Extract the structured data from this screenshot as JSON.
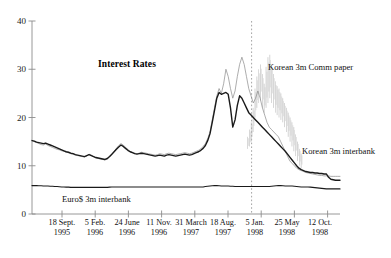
{
  "chart_data": {
    "type": "line",
    "title": "Interest Rates",
    "xlabel": "",
    "ylabel": "",
    "ylim": [
      0,
      40
    ],
    "yticks": [
      0,
      10,
      20,
      30,
      40
    ],
    "grid": false,
    "legend_position": "inline-annotations",
    "xtick_labels": [
      {
        "line1": "18 Sept.",
        "line2": "1995"
      },
      {
        "line1": "5 Feb.",
        "line2": "1996"
      },
      {
        "line1": "24 June",
        "line2": "1996"
      },
      {
        "line1": "11 Nov.",
        "line2": "1996"
      },
      {
        "line1": "31 March",
        "line2": "1997"
      },
      {
        "line1": "18 Aug.",
        "line2": "1997"
      },
      {
        "line1": "5 Jan.",
        "line2": "1998"
      },
      {
        "line1": "25 May",
        "line2": "1998"
      },
      {
        "line1": "12 Oct.",
        "line2": "1998"
      }
    ],
    "annotations": [
      {
        "text": "Korean 3m Comm paper",
        "x_frac": 0.745,
        "y_value": 30.5
      },
      {
        "text": "Korean 3m interbank",
        "x_frac": 0.845,
        "y_value": 13.0
      },
      {
        "text": "Euro$ 3m interbank",
        "x_frac": 0.245,
        "y_value": 3.4
      }
    ],
    "vertical_marker": {
      "label": "",
      "x_frac": 0.713,
      "style": "dotted"
    },
    "series": [
      {
        "name": "Korean 3m Comm paper",
        "color": "#8a8a8a",
        "width": 0.7,
        "values": [
          15.3,
          15.0,
          14.8,
          14.6,
          14.4,
          14.3,
          14.5,
          14.2,
          14.0,
          13.8,
          13.6,
          13.4,
          13.3,
          13.1,
          13.0,
          12.8,
          12.7,
          12.5,
          12.4,
          12.2,
          12.1,
          12.0,
          11.9,
          11.8,
          12.0,
          12.4,
          12.2,
          11.9,
          11.6,
          11.5,
          11.4,
          11.3,
          11.2,
          11.4,
          11.8,
          12.4,
          13.0,
          13.6,
          14.2,
          14.6,
          14.3,
          13.8,
          13.4,
          13.0,
          12.8,
          12.6,
          12.5,
          12.6,
          12.8,
          12.7,
          12.6,
          12.5,
          12.4,
          12.3,
          12.2,
          12.3,
          12.5,
          12.4,
          12.3,
          12.5,
          12.6,
          12.5,
          12.4,
          12.3,
          12.4,
          12.5,
          12.6,
          12.7,
          12.6,
          12.5,
          12.6,
          12.8,
          13.0,
          13.2,
          13.5,
          14.0,
          14.6,
          15.6,
          17.0,
          19.5,
          22.0,
          24.5,
          26.0,
          25.0,
          27.0,
          30.0,
          28.5,
          26.0,
          24.0,
          25.5,
          28.5,
          31.0,
          32.5,
          31.0,
          28.5,
          26.0,
          24.5,
          23.0,
          24.0,
          25.5,
          24.0,
          22.0,
          20.5,
          19.0,
          18.0,
          17.5,
          17.0,
          16.5,
          16.0,
          15.0,
          14.0,
          13.0,
          12.0,
          11.0,
          10.5,
          10.0,
          9.5,
          9.2,
          9.0,
          8.8,
          8.6,
          8.5,
          8.4,
          8.3,
          8.2,
          8.1,
          8.0,
          8.0,
          7.9,
          7.9,
          7.9,
          7.8,
          7.8,
          7.8,
          7.8,
          7.8
        ]
      },
      {
        "name": "Korean 3m interbank",
        "color": "#1a1a1a",
        "width": 1.4,
        "values": [
          15.2,
          15.1,
          14.9,
          14.8,
          14.7,
          14.6,
          14.7,
          14.5,
          14.3,
          14.1,
          13.9,
          13.7,
          13.5,
          13.3,
          13.1,
          12.9,
          12.8,
          12.6,
          12.5,
          12.3,
          12.2,
          12.1,
          12.0,
          11.9,
          12.1,
          12.3,
          12.1,
          11.9,
          11.7,
          11.6,
          11.5,
          11.4,
          11.3,
          11.5,
          11.9,
          12.4,
          12.9,
          13.4,
          13.9,
          14.3,
          14.0,
          13.6,
          13.2,
          12.9,
          12.7,
          12.5,
          12.4,
          12.5,
          12.6,
          12.5,
          12.4,
          12.3,
          12.2,
          12.1,
          12.0,
          12.1,
          12.2,
          12.1,
          12.0,
          12.2,
          12.3,
          12.2,
          12.1,
          12.0,
          12.1,
          12.2,
          12.3,
          12.4,
          12.3,
          12.2,
          12.3,
          12.5,
          12.7,
          12.9,
          13.2,
          13.6,
          14.2,
          15.2,
          16.6,
          19.0,
          21.5,
          24.0,
          25.2,
          24.8,
          25.0,
          25.2,
          24.8,
          22.0,
          18.0,
          19.5,
          22.5,
          24.5,
          24.0,
          23.0,
          22.0,
          21.0,
          20.5,
          20.0,
          19.5,
          19.0,
          18.5,
          18.0,
          17.5,
          17.0,
          16.5,
          16.0,
          15.5,
          15.0,
          14.5,
          14.0,
          13.5,
          13.0,
          12.4,
          11.8,
          11.2,
          10.6,
          10.0,
          9.5,
          9.2,
          9.0,
          8.8,
          8.7,
          8.6,
          8.6,
          8.5,
          8.5,
          8.4,
          8.4,
          8.3,
          8.3,
          7.6,
          7.2,
          7.1,
          7.0,
          7.0,
          7.0
        ]
      },
      {
        "name": "Euro$ 3m interbank",
        "color": "#1a1a1a",
        "width": 1.2,
        "values": [
          5.9,
          5.9,
          5.9,
          5.85,
          5.85,
          5.8,
          5.8,
          5.8,
          5.75,
          5.75,
          5.7,
          5.7,
          5.65,
          5.6,
          5.6,
          5.55,
          5.55,
          5.5,
          5.5,
          5.5,
          5.5,
          5.5,
          5.5,
          5.5,
          5.5,
          5.5,
          5.5,
          5.5,
          5.5,
          5.5,
          5.5,
          5.5,
          5.5,
          5.5,
          5.55,
          5.6,
          5.6,
          5.6,
          5.6,
          5.6,
          5.6,
          5.6,
          5.6,
          5.6,
          5.6,
          5.6,
          5.6,
          5.6,
          5.6,
          5.6,
          5.6,
          5.6,
          5.6,
          5.6,
          5.6,
          5.6,
          5.6,
          5.6,
          5.6,
          5.6,
          5.6,
          5.6,
          5.6,
          5.6,
          5.6,
          5.6,
          5.6,
          5.6,
          5.6,
          5.6,
          5.6,
          5.6,
          5.6,
          5.6,
          5.6,
          5.6,
          5.7,
          5.75,
          5.8,
          5.85,
          5.9,
          5.9,
          5.85,
          5.8,
          5.8,
          5.8,
          5.8,
          5.75,
          5.75,
          5.7,
          5.7,
          5.7,
          5.7,
          5.7,
          5.7,
          5.7,
          5.7,
          5.7,
          5.7,
          5.7,
          5.7,
          5.7,
          5.7,
          5.7,
          5.7,
          5.75,
          5.8,
          5.85,
          5.9,
          5.9,
          5.85,
          5.8,
          5.8,
          5.8,
          5.8,
          5.75,
          5.7,
          5.65,
          5.6,
          5.6,
          5.6,
          5.6,
          5.55,
          5.5,
          5.45,
          5.4,
          5.35,
          5.3,
          5.25,
          5.2,
          5.2,
          5.2,
          5.2,
          5.2,
          5.2,
          5.2
        ]
      }
    ],
    "noise_band": {
      "name": "Korean 3m Comm paper intraday range",
      "color": "#b5b5b5",
      "spikes": [
        {
          "x_frac": 0.7,
          "low": 13.5,
          "high": 16.0
        },
        {
          "x_frac": 0.706,
          "low": 14.0,
          "high": 17.5
        },
        {
          "x_frac": 0.712,
          "low": 15.0,
          "high": 19.0
        },
        {
          "x_frac": 0.718,
          "low": 17.0,
          "high": 22.0
        },
        {
          "x_frac": 0.724,
          "low": 20.0,
          "high": 26.0
        },
        {
          "x_frac": 0.73,
          "low": 22.0,
          "high": 28.5
        },
        {
          "x_frac": 0.736,
          "low": 23.0,
          "high": 30.0
        },
        {
          "x_frac": 0.742,
          "low": 23.5,
          "high": 31.0
        },
        {
          "x_frac": 0.748,
          "low": 22.0,
          "high": 29.0
        },
        {
          "x_frac": 0.754,
          "low": 21.0,
          "high": 27.0
        },
        {
          "x_frac": 0.76,
          "low": 22.0,
          "high": 30.5
        },
        {
          "x_frac": 0.766,
          "low": 23.0,
          "high": 32.5
        },
        {
          "x_frac": 0.772,
          "low": 24.0,
          "high": 33.0
        },
        {
          "x_frac": 0.778,
          "low": 23.0,
          "high": 31.0
        },
        {
          "x_frac": 0.784,
          "low": 22.0,
          "high": 29.0
        },
        {
          "x_frac": 0.79,
          "low": 21.0,
          "high": 27.5
        },
        {
          "x_frac": 0.796,
          "low": 20.5,
          "high": 26.5
        },
        {
          "x_frac": 0.802,
          "low": 20.0,
          "high": 26.0
        },
        {
          "x_frac": 0.808,
          "low": 19.5,
          "high": 25.0
        },
        {
          "x_frac": 0.814,
          "low": 19.0,
          "high": 24.0
        },
        {
          "x_frac": 0.82,
          "low": 18.0,
          "high": 23.0
        },
        {
          "x_frac": 0.826,
          "low": 17.0,
          "high": 22.0
        },
        {
          "x_frac": 0.832,
          "low": 16.0,
          "high": 21.0
        },
        {
          "x_frac": 0.838,
          "low": 15.0,
          "high": 20.0
        },
        {
          "x_frac": 0.844,
          "low": 14.0,
          "high": 19.0
        },
        {
          "x_frac": 0.85,
          "low": 13.0,
          "high": 18.0
        },
        {
          "x_frac": 0.856,
          "low": 12.0,
          "high": 16.5
        },
        {
          "x_frac": 0.862,
          "low": 11.0,
          "high": 15.0
        },
        {
          "x_frac": 0.868,
          "low": 10.0,
          "high": 13.5
        },
        {
          "x_frac": 0.874,
          "low": 9.5,
          "high": 12.5
        }
      ]
    }
  },
  "figure": {
    "background_color": "#ffffff",
    "axis_color": "#8c8c8c",
    "text_color": "#111111"
  }
}
